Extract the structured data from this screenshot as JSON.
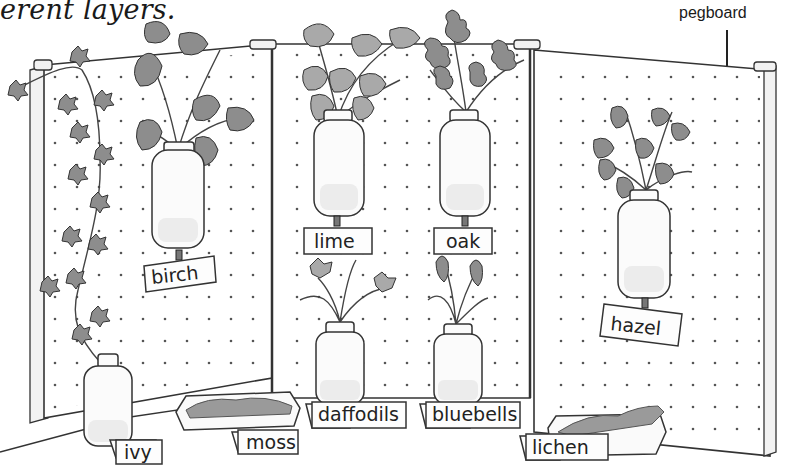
{
  "caption": {
    "text": "erent layers."
  },
  "callout": {
    "label": "pegboard"
  },
  "display": {
    "panels": [
      "left-panel",
      "center-panel",
      "right-panel"
    ],
    "hanging_jars": [
      {
        "plant": "birch",
        "label": "birch"
      },
      {
        "plant": "lime",
        "label": "lime"
      },
      {
        "plant": "oak",
        "label": "oak"
      },
      {
        "plant": "hazel",
        "label": "hazel"
      }
    ],
    "floor_items": [
      {
        "plant": "ivy",
        "label": "ivy"
      },
      {
        "plant": "moss",
        "label": "moss"
      },
      {
        "plant": "daffodils",
        "label": "daffodils"
      },
      {
        "plant": "bluebells",
        "label": "bluebells"
      },
      {
        "plant": "lichen",
        "label": "lichen"
      }
    ]
  },
  "colors": {
    "ink": "#333333",
    "leaf": "#8d8d8d",
    "background": "#ffffff"
  }
}
